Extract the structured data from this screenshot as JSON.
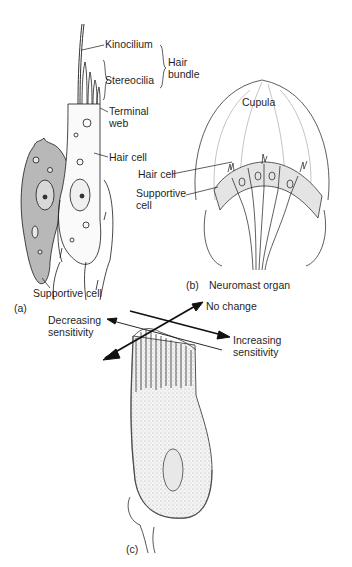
{
  "panel_a": {
    "tag": "(a)",
    "labels": {
      "kinocilium": "Kinocilium",
      "stereocilia": "Stereocilia",
      "hair_bundle": "Hair bundle",
      "terminal_web": "Terminal web",
      "hair_cell": "Hair cell",
      "supportive_cell": "Supportive cell"
    }
  },
  "panel_b": {
    "tag": "(b)",
    "caption": "Neuromast organ",
    "labels": {
      "cupula": "Cupula",
      "hair_cell": "Hair cell",
      "supportive_cell": "Supportive cell"
    }
  },
  "panel_c": {
    "tag": "(c)",
    "labels": {
      "no_change": "No change",
      "decreasing": "Decreasing sensitivity",
      "increasing": "Increasing sensitivity"
    }
  },
  "colors": {
    "ink": "#1a1a1a",
    "cell_gray": "#b8b8b8",
    "cell_light": "#e4e4e4",
    "stipple": "#d9d9d9"
  }
}
